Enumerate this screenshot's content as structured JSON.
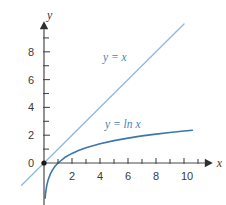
{
  "chart_data": {
    "type": "line",
    "title": "",
    "subtitle": "",
    "xlabel": "x",
    "ylabel": "y",
    "xlim": [
      -1.6,
      12.2
    ],
    "ylim": [
      -2.6,
      10.2
    ],
    "grid": false,
    "legend_position": "inline-annotations",
    "x_ticks_major": [
      2,
      4,
      6,
      8,
      10
    ],
    "x_ticks_all": [
      1,
      2,
      3,
      4,
      5,
      6,
      7,
      8,
      9,
      10,
      11
    ],
    "x_tick_labels": [
      "2",
      "4",
      "6",
      "8",
      "10"
    ],
    "y_ticks_major": [
      0,
      2,
      4,
      6,
      8
    ],
    "y_ticks_all": [
      1,
      2,
      3,
      4,
      5,
      6,
      7,
      8,
      9
    ],
    "y_tick_labels": [
      "0",
      "2",
      "4",
      "6",
      "8"
    ],
    "origin_marker": true,
    "series": [
      {
        "name": "y = x",
        "label": "y = x",
        "color": "#8fb8dd",
        "x": [
          -1.6,
          10.0
        ],
        "values": [
          -1.6,
          10.0
        ]
      },
      {
        "name": "y = ln x",
        "label": "y = ln x",
        "color": "#3a77aa",
        "x": [
          0.08,
          0.12,
          0.2,
          0.3,
          0.45,
          0.6,
          0.8,
          1.0,
          1.5,
          2.0,
          2.5,
          3.0,
          4.0,
          5.0,
          6.0,
          7.0,
          8.0,
          9.0,
          10.0,
          10.6
        ],
        "values": [
          -2.53,
          -2.12,
          -1.61,
          -1.2,
          -0.8,
          -0.51,
          -0.22,
          0.0,
          0.41,
          0.69,
          0.92,
          1.1,
          1.39,
          1.61,
          1.79,
          1.95,
          2.08,
          2.2,
          2.3,
          2.36
        ]
      }
    ]
  },
  "axes": {
    "x_axis_name": "x",
    "y_axis_name": "y"
  },
  "annotations": [
    {
      "text": "y = x",
      "x_px": 103,
      "y_px": 52
    },
    {
      "text": "y = ln x",
      "x_px": 105,
      "y_px": 119
    }
  ],
  "colors": {
    "line_light_blue": "#8fb8dd",
    "curve_blue": "#3a77aa",
    "axis_gray": "#4a4a4a",
    "label_gray": "#3a3a3a",
    "annotation_blue": "#4a7fb5",
    "background": "#ffffff"
  }
}
